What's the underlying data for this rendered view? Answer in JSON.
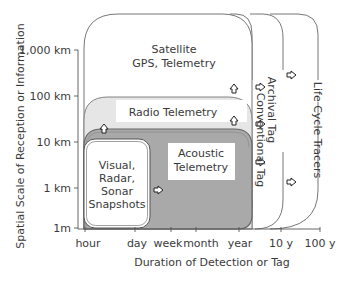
{
  "axes": {
    "x_label": "Duration of Detection or Tag",
    "y_label": "Spatial Scale of Reception or Information",
    "x_ticks": [
      "hour",
      "day",
      "week",
      "month",
      "year",
      "10 y",
      "100 y"
    ],
    "y_ticks": [
      "1,000 km",
      "100 km",
      "10 km",
      "1 km",
      "1m"
    ]
  },
  "regions": {
    "satellite": {
      "line1": "Satellite",
      "line2": "GPS, Telemetry"
    },
    "radio": {
      "label": "Radio Telemetry"
    },
    "acoustic": {
      "line1": "Acoustic",
      "line2": "Telemetry"
    },
    "visual": {
      "line1": "Visual,",
      "line2": "Radar,",
      "line3": "Sonar",
      "line4": "Snapshots"
    },
    "conventional_tag": {
      "label": "Conventional Tag"
    },
    "archival_tag": {
      "label": "Archival Tag"
    },
    "life_cycle": {
      "label": "Life Cycle Tracers"
    }
  },
  "colors": {
    "radio_fill": "#e6e6e6",
    "acoustic_fill": "#a9a9a9",
    "label_bg": "#ffffff",
    "line": "#555555"
  }
}
